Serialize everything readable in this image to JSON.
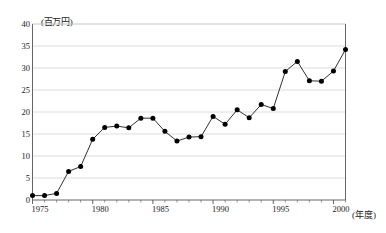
{
  "chart_data": {
    "type": "line",
    "title": "",
    "subtitle": "",
    "xlabel": "(年度)",
    "ylabel": "(百万円)",
    "xlim": [
      1975,
      2001
    ],
    "ylim": [
      0,
      40
    ],
    "grid": "horizontal",
    "legend": "none",
    "marker": "filled-circle",
    "line_color": "#1a1a1a",
    "marker_color": "#000000",
    "grid_color": "#c8c8c8",
    "axis_color": "#555555",
    "y_ticks": [
      0,
      5,
      10,
      15,
      20,
      25,
      30,
      35,
      40
    ],
    "y_tick_labels": [
      "0",
      "5",
      "10",
      "15",
      "20",
      "25",
      "30",
      "35",
      "40"
    ],
    "x_ticks": [
      1975,
      1980,
      1985,
      1990,
      1995,
      2000
    ],
    "x_tick_labels": [
      "1975",
      "1980",
      "1985",
      "1990",
      "1995",
      "2000"
    ],
    "x": [
      1975,
      1976,
      1977,
      1978,
      1979,
      1980,
      1981,
      1982,
      1983,
      1984,
      1985,
      1986,
      1987,
      1988,
      1989,
      1990,
      1991,
      1992,
      1993,
      1994,
      1995,
      1996,
      1997,
      1998,
      1999,
      2000,
      2001
    ],
    "values": [
      1.0,
      1.0,
      1.5,
      6.5,
      7.6,
      13.8,
      16.5,
      16.8,
      16.4,
      18.6,
      18.6,
      15.6,
      13.4,
      14.3,
      14.4,
      19.0,
      17.2,
      20.5,
      18.7,
      21.7,
      20.8,
      29.2,
      31.5,
      27.1,
      27.0,
      29.3,
      34.2
    ]
  }
}
